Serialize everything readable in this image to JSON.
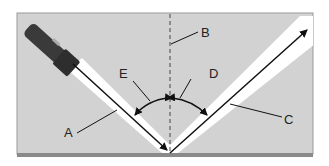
{
  "diagram": {
    "type": "reflection-of-light",
    "labels": {
      "A": "A",
      "B": "B",
      "C": "C",
      "D": "D",
      "E": "E"
    },
    "colors": {
      "background": "#d2d2d2",
      "beam": "#ffffff",
      "ray": "#111111",
      "mirror": "#8a8a8a",
      "flashlight": "#3a3a3a"
    }
  }
}
